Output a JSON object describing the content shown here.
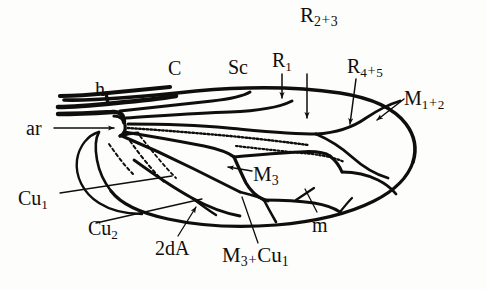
{
  "figure": {
    "kind": "insect-wing-venation-diagram",
    "background_color": "#fdfdfb",
    "ink_color": "#100e0c",
    "width": 486,
    "height": 289
  },
  "labels": {
    "r23": {
      "base": "R",
      "sub1": "2",
      "op": "+",
      "sub2": "3",
      "text": "R2+3"
    },
    "c": {
      "base": "C",
      "text": "C"
    },
    "sc": {
      "base": "Sc",
      "text": "Sc"
    },
    "r1": {
      "base": "R",
      "sub1": "1",
      "text": "R1"
    },
    "r45": {
      "base": "R",
      "sub1": "4",
      "op": "+",
      "sub2": "5",
      "text": "R4+5"
    },
    "m12": {
      "base": "M",
      "sub1": "1",
      "op": "+",
      "sub2": "2",
      "text": "M1+2"
    },
    "h": {
      "base": "h",
      "text": "h"
    },
    "ar": {
      "base": "ar",
      "text": "ar"
    },
    "m3": {
      "base": "M",
      "sub1": "3",
      "text": "M3"
    },
    "cu1": {
      "base": "Cu",
      "sub1": "1",
      "text": "Cu1"
    },
    "cu2": {
      "base": "Cu",
      "sub1": "2",
      "text": "Cu2"
    },
    "twoda": {
      "base": "2dA",
      "text": "2dA"
    },
    "m3cu1": {
      "base1": "M",
      "sub1": "3",
      "op": "+",
      "base2": "Cu",
      "sub2": "1",
      "text": "M3 + Cu1"
    },
    "m": {
      "base": "m",
      "text": "m"
    }
  },
  "leader_lines": [
    {
      "name": "r1-pointer",
      "type": "arrow",
      "from": [
        282,
        74
      ],
      "to": [
        282,
        98
      ]
    },
    {
      "name": "r23-pointer",
      "type": "arrow",
      "from": [
        307,
        74
      ],
      "to": [
        307,
        118
      ]
    },
    {
      "name": "r45-pointer",
      "type": "arrow",
      "from": [
        355,
        78
      ],
      "to": [
        351,
        124
      ]
    },
    {
      "name": "m12-pointer",
      "type": "arrow",
      "from": [
        404,
        98
      ],
      "to": [
        375,
        120
      ]
    },
    {
      "name": "ar-pointer",
      "type": "arrow",
      "from": [
        55,
        128
      ],
      "to": [
        113,
        128
      ]
    },
    {
      "name": "m3-pointer",
      "type": "arrow",
      "from": [
        252,
        172
      ],
      "to": [
        228,
        168
      ]
    },
    {
      "name": "cu1-pointer",
      "type": "line",
      "from": [
        60,
        192
      ],
      "to": [
        170,
        176
      ]
    },
    {
      "name": "cu2-pointer",
      "type": "line",
      "from": [
        96,
        222
      ],
      "to": [
        200,
        198
      ]
    },
    {
      "name": "2da-pointer",
      "type": "arrow",
      "from": [
        178,
        236
      ],
      "to": [
        196,
        208
      ]
    },
    {
      "name": "m3cu1-pointer",
      "type": "line",
      "from": [
        258,
        243
      ],
      "to": [
        240,
        198
      ]
    },
    {
      "name": "m-pointer",
      "type": "line",
      "from": [
        316,
        212
      ],
      "to": [
        304,
        190
      ]
    }
  ]
}
